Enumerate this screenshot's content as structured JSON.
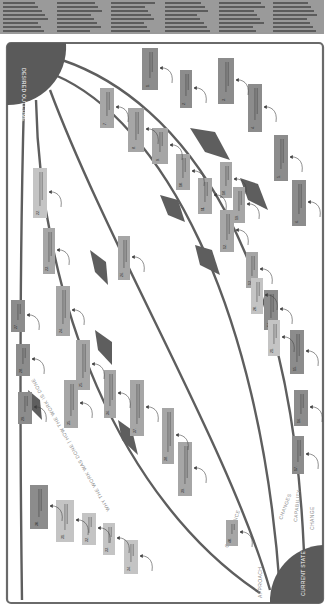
{
  "header": {
    "text_columns": 6,
    "legible": false
  },
  "diagram": {
    "orientation": "rotated-90-clockwise",
    "corner_labels": {
      "desired_outcome": "DESIRED OUTCOME",
      "current_state": "CURRENT STATE"
    },
    "lane_labels": [
      "APPROACH",
      "GOVERNANCE",
      "CHANGES",
      "CAPABILITY",
      "CHANGE"
    ],
    "divider_label": "WHY THE WORK WAS DONE | HOW THE WORK IS DONE",
    "colors": {
      "corner_fill": "#5a5a5a",
      "lane_line": "#5e5e5e",
      "box_dark": "#8c8c8c",
      "box_mid": "#a6a6a6",
      "box_light": "#c4c4c4",
      "frame": "#6a6a6a"
    },
    "boxes": [
      {
        "id": 1,
        "label": "1."
      },
      {
        "id": 2,
        "label": "2."
      },
      {
        "id": 3,
        "label": "3."
      },
      {
        "id": 4,
        "label": "4."
      },
      {
        "id": 5,
        "label": "5."
      },
      {
        "id": 6,
        "label": "6."
      },
      {
        "id": 7,
        "label": "7."
      },
      {
        "id": 8,
        "label": "8."
      },
      {
        "id": 9,
        "label": "9."
      },
      {
        "id": 10,
        "label": "10."
      },
      {
        "id": 11,
        "label": "11."
      },
      {
        "id": 12,
        "label": "12."
      },
      {
        "id": 13,
        "label": "13."
      },
      {
        "id": 14,
        "label": "14."
      },
      {
        "id": 15,
        "label": "15."
      },
      {
        "id": 16,
        "label": "16."
      },
      {
        "id": 17,
        "label": "17."
      },
      {
        "id": 18,
        "label": "18."
      },
      {
        "id": 19,
        "label": "19."
      },
      {
        "id": 20,
        "label": "20."
      },
      {
        "id": 21,
        "label": "21."
      },
      {
        "id": 22,
        "label": "22."
      },
      {
        "id": 23,
        "label": "23."
      },
      {
        "id": 24,
        "label": "24."
      },
      {
        "id": 25,
        "label": "25."
      },
      {
        "id": 26,
        "label": "26."
      },
      {
        "id": 27,
        "label": "27."
      },
      {
        "id": 28,
        "label": "28."
      },
      {
        "id": 29,
        "label": "29."
      },
      {
        "id": 30,
        "label": "30."
      },
      {
        "id": 31,
        "label": "31."
      },
      {
        "id": 32,
        "label": "32."
      },
      {
        "id": 33,
        "label": "33."
      },
      {
        "id": 34,
        "label": "34."
      },
      {
        "id": 35,
        "label": "35."
      },
      {
        "id": 36,
        "label": "36."
      },
      {
        "id": 37,
        "label": "37."
      },
      {
        "id": 38,
        "label": "38."
      },
      {
        "id": 39,
        "label": "39."
      },
      {
        "id": 40,
        "label": "40."
      }
    ]
  }
}
